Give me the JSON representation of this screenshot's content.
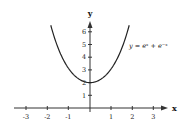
{
  "chart_data": {
    "type": "line",
    "title": "",
    "xlabel": "x",
    "ylabel": "y",
    "xlim": [
      -3.4,
      3.6
    ],
    "ylim": [
      0,
      6.8
    ],
    "grid": false,
    "x_ticks": [
      -3,
      -2,
      -1,
      1,
      2,
      3
    ],
    "x_tick_labels": [
      "-3",
      "-2",
      "-1",
      "1",
      "2",
      "3"
    ],
    "y_ticks": [
      1,
      2,
      3,
      4,
      5,
      6
    ],
    "y_tick_labels": [
      "1",
      "2",
      "3",
      "4",
      "5",
      "6"
    ],
    "series": [
      {
        "name": "y = e^x + e^-x",
        "label": "y = eˣ + e⁻ˣ",
        "x": [
          -1.85,
          -1.5,
          -1.0,
          -0.5,
          0,
          0.5,
          1.0,
          1.5,
          1.85
        ],
        "y": [
          6.52,
          4.7,
          3.09,
          2.26,
          2.0,
          2.26,
          3.09,
          4.7,
          6.52
        ]
      }
    ],
    "annotations": [
      {
        "text": "y = eˣ + e⁻ˣ",
        "x": 1.8,
        "y": 4.9
      }
    ]
  },
  "labels": {
    "x_axis": "x",
    "y_axis": "y",
    "curve": "y = eˣ + e⁻ˣ",
    "x_ticks": [
      "-3",
      "-2",
      "-1",
      "1",
      "2",
      "3"
    ],
    "y_ticks": [
      "1",
      "2",
      "3",
      "4",
      "5",
      "6"
    ]
  },
  "colors": {
    "curve": "#222222",
    "axis": "#333333",
    "background": "#ffffff"
  }
}
